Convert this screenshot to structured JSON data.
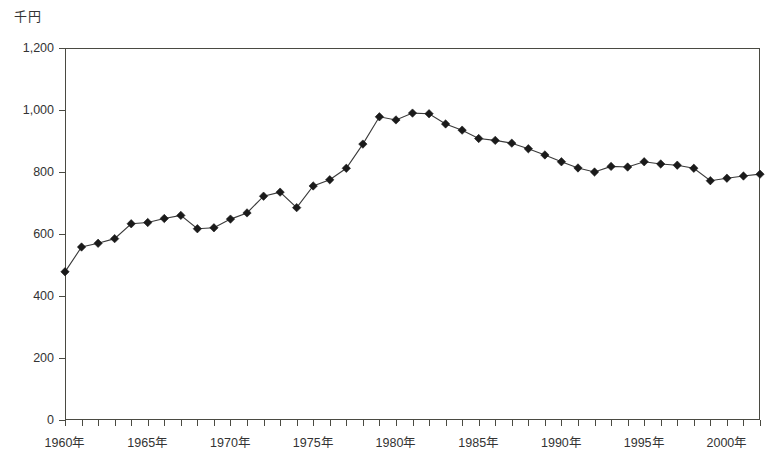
{
  "chart_data": {
    "type": "line",
    "title": "",
    "unit_label": "千円",
    "xlabel": "",
    "ylabel": "千円",
    "grid": true,
    "legend": "none",
    "xlim": [
      1960,
      2002
    ],
    "ylim": [
      0,
      1200
    ],
    "y_ticks": [
      "0",
      "200",
      "400",
      "600",
      "800",
      "1,000",
      "1,200"
    ],
    "y_tick_values": [
      0,
      200,
      400,
      600,
      800,
      1000,
      1200
    ],
    "x_tick_labels": [
      "1960年",
      "1965年",
      "1970年",
      "1975年",
      "1980年",
      "1985年",
      "1990年",
      "1995年",
      "2000年"
    ],
    "x_tick_values": [
      1960,
      1965,
      1970,
      1975,
      1980,
      1985,
      1990,
      1995,
      2000
    ],
    "x": [
      1960,
      1961,
      1962,
      1963,
      1964,
      1965,
      1966,
      1967,
      1968,
      1969,
      1970,
      1971,
      1972,
      1973,
      1974,
      1975,
      1976,
      1977,
      1978,
      1979,
      1980,
      1981,
      1982,
      1983,
      1984,
      1985,
      1986,
      1987,
      1988,
      1989,
      1990,
      1991,
      1992,
      1993,
      1994,
      1995,
      1996,
      1997,
      1998,
      1999,
      2000,
      2001,
      2002
    ],
    "values": [
      478,
      558,
      570,
      585,
      633,
      637,
      650,
      660,
      617,
      620,
      648,
      668,
      722,
      735,
      685,
      755,
      775,
      812,
      890,
      978,
      968,
      990,
      988,
      955,
      935,
      908,
      902,
      893,
      875,
      855,
      833,
      813,
      800,
      818,
      816,
      833,
      826,
      822,
      812,
      772,
      780,
      787,
      793
    ],
    "marker": "diamond",
    "line_color": "#3a3a3a",
    "marker_color": "#1a1a1a",
    "grid_color": "#6f6f5c",
    "axis_color": "#4a4a42"
  }
}
